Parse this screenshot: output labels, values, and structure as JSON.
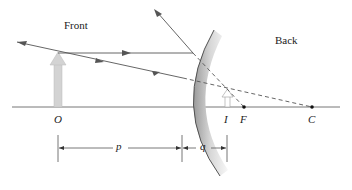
{
  "diagram": {
    "labels": {
      "front": "Front",
      "back": "Back",
      "object": "O",
      "image": "I",
      "focal_point": "F",
      "center_of_curvature": "C",
      "object_distance": "p",
      "image_distance": "q"
    },
    "colors": {
      "ray": "#555555",
      "axis": "#777777",
      "object_arrow": "#d0d0d0",
      "mirror_shade": "#bdbdbd",
      "text": "#222222"
    }
  }
}
